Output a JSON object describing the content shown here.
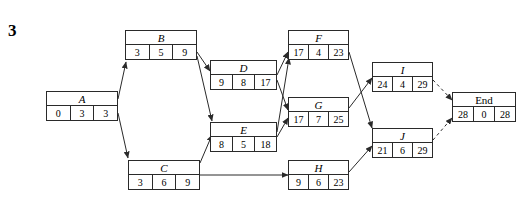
{
  "problem": {
    "number": "3"
  },
  "diagram": {
    "type": "activity-on-node-network",
    "nodes": [
      {
        "id": "A",
        "label": "A",
        "italic": true,
        "cells": [
          "0",
          "3",
          "3"
        ],
        "x": 46,
        "y": 91,
        "w": 72,
        "h": 30
      },
      {
        "id": "B",
        "label": "B",
        "italic": true,
        "cells": [
          "3",
          "5",
          "9"
        ],
        "x": 125,
        "y": 30,
        "w": 72,
        "h": 30
      },
      {
        "id": "C",
        "label": "C",
        "italic": true,
        "cells": [
          "3",
          "6",
          "9"
        ],
        "x": 128,
        "y": 160,
        "w": 72,
        "h": 30
      },
      {
        "id": "D",
        "label": "D",
        "italic": true,
        "cells": [
          "9",
          "8",
          "17"
        ],
        "x": 210,
        "y": 60,
        "w": 67,
        "h": 30
      },
      {
        "id": "E",
        "label": "E",
        "italic": true,
        "cells": [
          "8",
          "5",
          "18"
        ],
        "x": 210,
        "y": 122,
        "w": 67,
        "h": 30
      },
      {
        "id": "F",
        "label": "F",
        "italic": true,
        "cells": [
          "17",
          "4",
          "23"
        ],
        "x": 288,
        "y": 30,
        "w": 61,
        "h": 30
      },
      {
        "id": "G",
        "label": "G",
        "italic": true,
        "cells": [
          "17",
          "7",
          "25"
        ],
        "x": 288,
        "y": 97,
        "w": 61,
        "h": 30
      },
      {
        "id": "H",
        "label": "H",
        "italic": true,
        "cells": [
          "9",
          "6",
          "23"
        ],
        "x": 288,
        "y": 160,
        "w": 61,
        "h": 30
      },
      {
        "id": "I",
        "label": "I",
        "italic": true,
        "cells": [
          "24",
          "4",
          "29"
        ],
        "x": 372,
        "y": 62,
        "w": 61,
        "h": 30
      },
      {
        "id": "J",
        "label": "J",
        "italic": true,
        "cells": [
          "21",
          "6",
          "29"
        ],
        "x": 372,
        "y": 128,
        "w": 61,
        "h": 30
      },
      {
        "id": "End",
        "label": "End",
        "italic": false,
        "cells": [
          "28",
          "0",
          "28"
        ],
        "x": 452,
        "y": 92,
        "w": 64,
        "h": 30
      }
    ],
    "edges": [
      {
        "from": "A",
        "to": "B",
        "style": "solid"
      },
      {
        "from": "A",
        "to": "C",
        "style": "solid"
      },
      {
        "from": "B",
        "to": "D",
        "style": "solid"
      },
      {
        "from": "B",
        "to": "E",
        "style": "solid"
      },
      {
        "from": "C",
        "to": "E",
        "style": "solid"
      },
      {
        "from": "C",
        "to": "H",
        "style": "solid"
      },
      {
        "from": "D",
        "to": "F",
        "style": "solid"
      },
      {
        "from": "D",
        "to": "G",
        "style": "solid"
      },
      {
        "from": "E",
        "to": "F",
        "style": "solid"
      },
      {
        "from": "E",
        "to": "G",
        "style": "solid"
      },
      {
        "from": "F",
        "to": "J",
        "style": "solid"
      },
      {
        "from": "G",
        "to": "I",
        "style": "solid"
      },
      {
        "from": "H",
        "to": "J",
        "style": "solid"
      },
      {
        "from": "I",
        "to": "End",
        "style": "dashed"
      },
      {
        "from": "J",
        "to": "End",
        "style": "dashed"
      }
    ],
    "colors": {
      "line": "#2a2a2a",
      "box_border": "#2a2a2a",
      "background": "#ffffff",
      "text": "#000000"
    }
  }
}
